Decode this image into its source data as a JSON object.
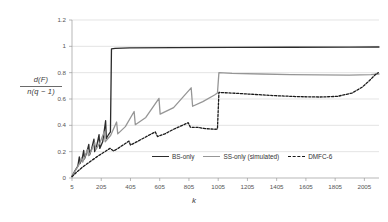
{
  "chart_data": {
    "type": "line",
    "title": "",
    "xlabel": "k",
    "ylabel_numerator": "d(F)",
    "ylabel_denominator": "n(q − 1)",
    "xlim": [
      5,
      2105
    ],
    "ylim": [
      0,
      1.2
    ],
    "xticks": [
      5,
      205,
      405,
      605,
      805,
      1005,
      1205,
      1405,
      1605,
      1805,
      2005
    ],
    "yticks": [
      "0",
      "0.2",
      "0.4",
      "0.6",
      "0.8",
      "1",
      "1.2"
    ],
    "ytick_values": [
      0,
      0.2,
      0.4,
      0.6,
      0.8,
      1,
      1.2
    ],
    "grid": true,
    "legend_position": "bottom-center",
    "series": [
      {
        "name": "BS-only",
        "color": "#2b2b2b",
        "style": "solid",
        "width": 1.3,
        "points": [
          [
            5,
            0.012
          ],
          [
            25,
            0.055
          ],
          [
            45,
            0.09
          ],
          [
            55,
            0.16
          ],
          [
            60,
            0.11
          ],
          [
            75,
            0.15
          ],
          [
            85,
            0.21
          ],
          [
            90,
            0.145
          ],
          [
            105,
            0.19
          ],
          [
            120,
            0.255
          ],
          [
            125,
            0.175
          ],
          [
            140,
            0.225
          ],
          [
            155,
            0.295
          ],
          [
            160,
            0.2
          ],
          [
            175,
            0.25
          ],
          [
            190,
            0.33
          ],
          [
            195,
            0.225
          ],
          [
            215,
            0.275
          ],
          [
            235,
            0.435
          ],
          [
            240,
            0.3
          ],
          [
            255,
            0.33
          ],
          [
            268,
            0.35
          ],
          [
            275,
            0.98
          ],
          [
            300,
            0.985
          ],
          [
            400,
            0.988
          ],
          [
            700,
            0.99
          ],
          [
            1100,
            0.992
          ],
          [
            1500,
            0.993
          ],
          [
            1900,
            0.994
          ],
          [
            2105,
            0.995
          ]
        ]
      },
      {
        "name": "SS-only (simulated)",
        "color": "#969696",
        "style": "solid",
        "width": 1.3,
        "points": [
          [
            5,
            0.012
          ],
          [
            30,
            0.06
          ],
          [
            55,
            0.105
          ],
          [
            70,
            0.155
          ],
          [
            78,
            0.12
          ],
          [
            95,
            0.165
          ],
          [
            110,
            0.215
          ],
          [
            118,
            0.17
          ],
          [
            140,
            0.215
          ],
          [
            160,
            0.27
          ],
          [
            168,
            0.215
          ],
          [
            195,
            0.265
          ],
          [
            225,
            0.35
          ],
          [
            232,
            0.275
          ],
          [
            270,
            0.325
          ],
          [
            310,
            0.425
          ],
          [
            318,
            0.335
          ],
          [
            370,
            0.39
          ],
          [
            430,
            0.505
          ],
          [
            438,
            0.405
          ],
          [
            510,
            0.46
          ],
          [
            600,
            0.605
          ],
          [
            608,
            0.485
          ],
          [
            700,
            0.535
          ],
          [
            820,
            0.685
          ],
          [
            830,
            0.545
          ],
          [
            900,
            0.58
          ],
          [
            980,
            0.63
          ],
          [
            1000,
            0.645
          ],
          [
            1010,
            0.8
          ],
          [
            1100,
            0.795
          ],
          [
            1300,
            0.79
          ],
          [
            1500,
            0.785
          ],
          [
            1700,
            0.783
          ],
          [
            1900,
            0.782
          ],
          [
            2050,
            0.785
          ],
          [
            2105,
            0.79
          ]
        ]
      },
      {
        "name": "DMFC-6",
        "color": "#1a1a1a",
        "style": "dashed",
        "width": 1.3,
        "points": [
          [
            5,
            0.01
          ],
          [
            40,
            0.048
          ],
          [
            80,
            0.085
          ],
          [
            130,
            0.125
          ],
          [
            180,
            0.165
          ],
          [
            230,
            0.2
          ],
          [
            265,
            0.225
          ],
          [
            290,
            0.205
          ],
          [
            320,
            0.225
          ],
          [
            360,
            0.255
          ],
          [
            395,
            0.28
          ],
          [
            405,
            0.25
          ],
          [
            440,
            0.27
          ],
          [
            490,
            0.3
          ],
          [
            540,
            0.33
          ],
          [
            575,
            0.35
          ],
          [
            590,
            0.315
          ],
          [
            640,
            0.335
          ],
          [
            700,
            0.37
          ],
          [
            760,
            0.4
          ],
          [
            800,
            0.42
          ],
          [
            815,
            0.385
          ],
          [
            860,
            0.385
          ],
          [
            920,
            0.375
          ],
          [
            980,
            0.37
          ],
          [
            1000,
            0.372
          ],
          [
            1010,
            0.65
          ],
          [
            1100,
            0.645
          ],
          [
            1250,
            0.635
          ],
          [
            1400,
            0.625
          ],
          [
            1550,
            0.618
          ],
          [
            1700,
            0.615
          ],
          [
            1820,
            0.62
          ],
          [
            1920,
            0.645
          ],
          [
            1990,
            0.69
          ],
          [
            2040,
            0.74
          ],
          [
            2080,
            0.785
          ],
          [
            2100,
            0.8
          ]
        ]
      }
    ],
    "legend": [
      {
        "label": "BS-only",
        "color": "#2b2b2b",
        "style": "solid"
      },
      {
        "label": "SS-only (simulated)",
        "color": "#969696",
        "style": "solid"
      },
      {
        "label": "DMFC-6",
        "color": "#1a1a1a",
        "style": "dashed"
      }
    ],
    "colors": {
      "axis": "#9a9a9a",
      "grid": "#d9d9d9",
      "text": "#555555",
      "background": "#ffffff"
    }
  }
}
